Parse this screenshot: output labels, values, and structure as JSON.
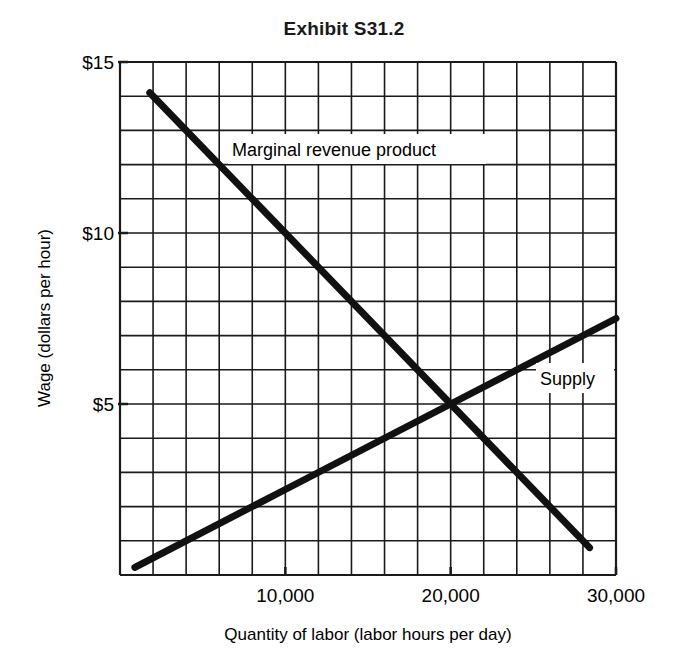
{
  "chart_data": {
    "type": "line",
    "title": "Exhibit S31.2",
    "xlabel": "Quantity of labor (labor hours per day)",
    "ylabel": "Wage (dollars per hour)",
    "xlim": [
      0,
      30000
    ],
    "ylim": [
      0,
      15
    ],
    "grid": true,
    "grid_spacing": {
      "x": 2000,
      "y": 1
    },
    "x_ticks": [
      10000,
      20000,
      30000
    ],
    "x_tick_labels": [
      "10,000",
      "20,000",
      "30,000"
    ],
    "y_ticks": [
      5,
      10,
      15
    ],
    "y_tick_labels": [
      "$5",
      "$10",
      "$15"
    ],
    "series": [
      {
        "name": "Marginal revenue product",
        "x": [
          1800,
          10000,
          20000,
          28400
        ],
        "y": [
          14.1,
          10,
          5,
          0.8
        ]
      },
      {
        "name": "Supply",
        "x": [
          900,
          10000,
          20000,
          30000
        ],
        "y": [
          0.225,
          2.5,
          5,
          7.5
        ]
      }
    ],
    "annotations": [
      {
        "text": "Marginal revenue product",
        "x": 6800,
        "y": 12.5
      },
      {
        "text": "Supply",
        "x": 25500,
        "y": 5.8
      }
    ],
    "equilibrium": {
      "x": 20000,
      "y": 5
    }
  }
}
